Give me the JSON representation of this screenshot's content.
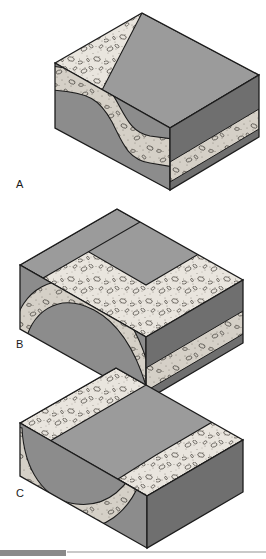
{
  "figure": {
    "blocks": [
      {
        "id": "A",
        "label": "A",
        "fold_type": "monocline",
        "description": "Horizontal strata with a single step-like flexure"
      },
      {
        "id": "B",
        "label": "B",
        "fold_type": "anticline",
        "description": "Upward arching fold with beds dipping away from the axis"
      },
      {
        "id": "C",
        "label": "C",
        "fold_type": "syncline",
        "description": "Downward trough fold with beds dipping toward the axis"
      }
    ],
    "rock_units": [
      {
        "name": "conglomerate",
        "pattern": "stippled-with-clasts",
        "color": "#e8e4dd"
      },
      {
        "name": "upper-massive-bed",
        "pattern": "solid",
        "color": "#8f8f8f"
      },
      {
        "name": "lower-massive-bed",
        "pattern": "solid",
        "color": "#8f8f8f"
      }
    ],
    "colors": {
      "background": "#ffffff",
      "top_face": "#9b9b9b",
      "front_face": "#8c8c8c",
      "side_face": "#6f6f6f",
      "stipple_light": "#e9e5de",
      "stipple_shadow": "#cfcac1",
      "outline": "#1c1c1c",
      "label_text": "#1a1a1a"
    }
  },
  "footer": {
    "bar_left_color": "#8a8a8a",
    "bar_right_color": "#c9c9c9"
  }
}
